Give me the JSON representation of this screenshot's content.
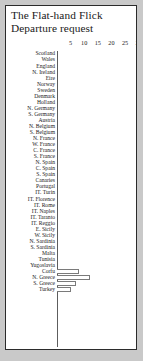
{
  "figure": {
    "title_line1": "The Flat-hand Flick",
    "title_line2": "Departure request",
    "frame_color": "#2b2b2b",
    "background_color": "#ffffff",
    "page_background": "#c9c9c9",
    "bar_outline_color": "#7a7a7a",
    "axis_color": "#5d5d5d"
  },
  "chart_data": {
    "type": "bar",
    "orientation": "horizontal",
    "title": "The Flat-hand Flick Departure request",
    "xlabel": "",
    "ylabel": "",
    "xlim": [
      0,
      32
    ],
    "grid": false,
    "legend": null,
    "tick_labels": [
      "5",
      "10",
      "15",
      "20",
      "25",
      "30"
    ],
    "tick_values": [
      5,
      10,
      15,
      20,
      25,
      30
    ],
    "categories": [
      "Scotland",
      "Wales",
      "England",
      "N. Ireland",
      "Eire",
      "Norway",
      "Sweden",
      "Denmark",
      "Holland",
      "N. Germany",
      "S. Germany",
      "Austria",
      "N. Belgium",
      "S. Belgium",
      "N. France",
      "W. France",
      "C. France",
      "S. France",
      "N. Spain",
      "C. Spain",
      "S. Spain",
      "Canaries",
      "Portugal",
      "IT. Turin",
      "IT. Florence",
      "IT. Rome",
      "IT. Naples",
      "IT. Taranto",
      "IT. Reggio",
      "E. Sicily",
      "W. Sicily",
      "N. Sardinia",
      "S. Sardinia",
      "Malta",
      "Tunisia",
      "Yugoslavia",
      "Corfu",
      "N. Greece",
      "S. Greece",
      "Turkey"
    ],
    "values": [
      0,
      0,
      0,
      0,
      0,
      0,
      0,
      0,
      0,
      0,
      0,
      0,
      0,
      0,
      0,
      0,
      0,
      0,
      0,
      0,
      0,
      0,
      0,
      0,
      0,
      0,
      0,
      0,
      0,
      0,
      0,
      0,
      0,
      0,
      0,
      0,
      8,
      12,
      7,
      5
    ]
  }
}
